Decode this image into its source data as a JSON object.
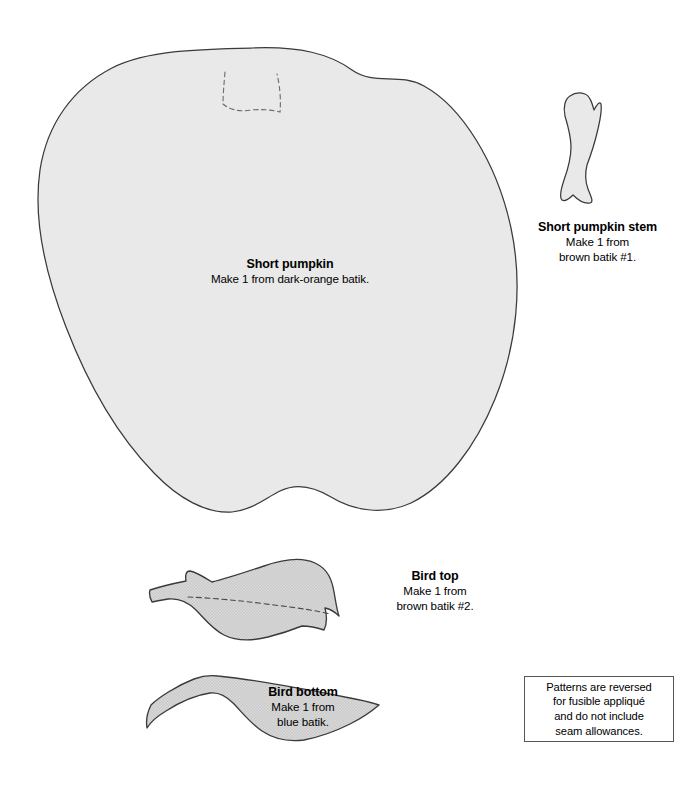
{
  "page": {
    "background_color": "#ffffff",
    "width": 685,
    "height": 795
  },
  "style": {
    "piece_fill": "#e9e9e9",
    "piece_fill_textured": "#d4d4d4",
    "outline_color": "#3a3a3c",
    "dashed_color": "#6b6b70",
    "note_border_color": "#56565a"
  },
  "pieces": [
    {
      "id": "short-pumpkin",
      "title": "Short pumpkin",
      "instruction": "Make 1 from dark-orange batik.",
      "fill": "#e9e9e9",
      "has_dashed_placement_line": true
    },
    {
      "id": "short-pumpkin-stem",
      "title": "Short pumpkin stem",
      "instruction_line_1": "Make 1 from",
      "instruction_line_2": "brown batik #1.",
      "fill": "#e9e9e9",
      "has_dashed_placement_line": false
    },
    {
      "id": "bird-top",
      "title": "Bird top",
      "instruction_line_1": "Make 1 from",
      "instruction_line_2": "brown batik #2.",
      "fill": "#d4d4d4",
      "has_dashed_placement_line": true
    },
    {
      "id": "bird-bottom",
      "title": "Bird bottom",
      "instruction_line_1": "Make 1 from",
      "instruction_line_2": "blue batik.",
      "fill": "#d4d4d4",
      "has_dashed_placement_line": false
    }
  ],
  "note": {
    "line_1": "Patterns are reversed",
    "line_2": "for fusible appliqué",
    "line_3": "and do not include",
    "line_4": "seam allowances."
  }
}
